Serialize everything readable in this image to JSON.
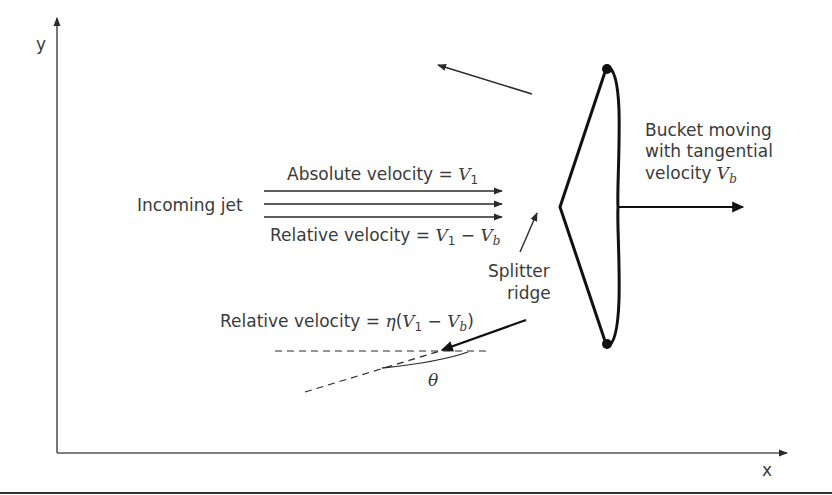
{
  "diagram": {
    "axes": {
      "x_label": "x",
      "y_label": "y"
    },
    "labels": {
      "incoming_jet": "Incoming jet",
      "absolute_velocity_prefix": "Absolute velocity = ",
      "absolute_velocity_var": "V",
      "absolute_velocity_sub": "1",
      "relative_velocity_prefix": "Relative velocity = ",
      "relative_velocity_v1": "V",
      "relative_velocity_v1_sub": "1",
      "relative_velocity_minus": " − ",
      "relative_velocity_vb": "V",
      "relative_velocity_vb_sub": "b",
      "splitter_line1": "Splitter",
      "splitter_line2": "ridge",
      "bucket_line1": "Bucket moving",
      "bucket_line2": "with tangential",
      "bucket_line3_prefix": "velocity ",
      "bucket_line3_var": "V",
      "bucket_line3_sub": "b",
      "exit_rel_prefix": "Relative velocity = ",
      "exit_rel_eta": "η",
      "exit_rel_open": "(",
      "exit_rel_v1": "V",
      "exit_rel_v1_sub": "1",
      "exit_rel_minus": " − ",
      "exit_rel_vb": "V",
      "exit_rel_vb_sub": "b",
      "exit_rel_close": ")",
      "angle": "θ"
    },
    "colors": {
      "ink": "#2a2a2a",
      "text": "#3a3a3a",
      "bucket": "#111111"
    }
  }
}
